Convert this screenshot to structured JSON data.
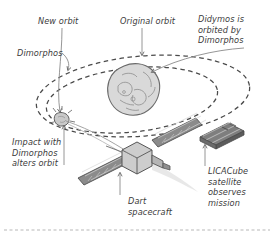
{
  "figure": {
    "background_color": "#ffffff",
    "line_color": "#4a4a4a",
    "asteroid_fill": "#d9d9d9",
    "panel_fill": "#6e6e6e",
    "body_fill": "#cfcfcf"
  },
  "labels": {
    "new_orbit": "New orbit",
    "original_orbit": "Original orbit",
    "didymos": "Didymos is\norbited by\nDimorphos",
    "dimorphos": "Dimorphos",
    "impact": "Impact with\nDimorphos\nalters orbit",
    "dart": "Dart\nspacecraft",
    "licacube": "LICACube\nsatellite\nobserves\nmission"
  },
  "objects": {
    "didymos_name": "Didymos asteroid",
    "dimorphos_name": "Dimorphos moonlet",
    "dart_name": "DART spacecraft",
    "licacube_name": "LICACube satellite",
    "original_orbit_name": "Original orbit ellipse",
    "new_orbit_name": "New orbit ellipse",
    "trajectory_name": "DART impact trajectory"
  }
}
